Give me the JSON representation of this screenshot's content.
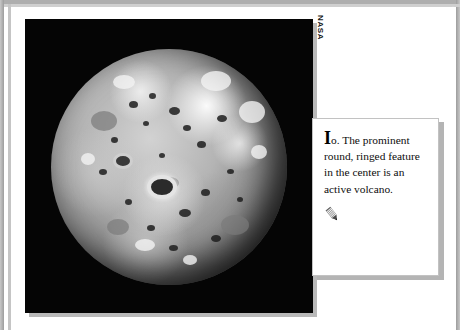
{
  "document": {
    "title": "Io",
    "photo": {
      "name": "io-photograph",
      "subject": "Io",
      "description": "Grayscale photograph of Jupiter's moon Io against black space",
      "background_color": "#050505"
    },
    "credit": {
      "text": "NASA",
      "orientation": "vertical"
    },
    "caption": {
      "drop_cap": "I",
      "body": "o. The prominent round, ringed feature in the center is an active volcano.",
      "full_text": "Io. The prominent round, ringed feature in the center is an active volcano.",
      "icon_name": "annotation-pen-icon"
    },
    "colors": {
      "frame": "#aeaeae",
      "page": "#ffffff",
      "shadow": "#b4b4b4",
      "caption_border": "#c2c2c2",
      "text": "#0d0d0d"
    }
  }
}
